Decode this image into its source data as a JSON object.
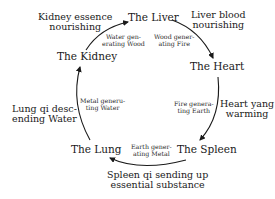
{
  "diagram": {
    "type": "five-element generation cycle",
    "nodes": {
      "liver": "The Liver",
      "heart": "The Heart",
      "spleen": "The Spleen",
      "lung": "The Lung",
      "kidney": "The Kidney"
    },
    "functions": {
      "liver": [
        "Liver blood",
        "nourishing"
      ],
      "heart": [
        "Heart yang",
        "warming"
      ],
      "spleen": [
        "Spleen qi sending up",
        "essential substance"
      ],
      "lung": [
        "Lung qi desc-",
        "ending Water"
      ],
      "kidney": [
        "Kidney essence",
        "nourishing"
      ]
    },
    "edges": [
      {
        "from": "kidney",
        "to": "liver",
        "label": [
          "Water gen-",
          "erating Wood"
        ]
      },
      {
        "from": "liver",
        "to": "heart",
        "label": [
          "Wood gener-",
          "ating Fire"
        ]
      },
      {
        "from": "heart",
        "to": "spleen",
        "label": [
          "Fire genera-",
          "ting Earth"
        ]
      },
      {
        "from": "spleen",
        "to": "lung",
        "label": [
          "Earth gener-",
          "ating Metal"
        ]
      },
      {
        "from": "lung",
        "to": "kidney",
        "label": [
          "Metal generu-",
          "ting Water"
        ]
      }
    ],
    "colors": {
      "stroke": "#1a1a1a",
      "background": "#ffffff"
    }
  }
}
